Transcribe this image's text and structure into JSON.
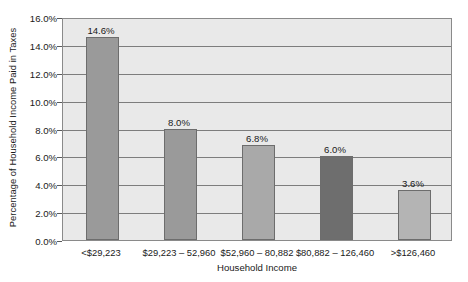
{
  "chart_data": {
    "type": "bar",
    "title": "",
    "xlabel": "Household Income",
    "ylabel": "Percentage of Household Income Paid in Taxes",
    "categories": [
      "<$29,223",
      "$29,223 – 52,960",
      "$52,960 – 80,882",
      "$80,882 – 126,460",
      ">$126,460"
    ],
    "values": [
      14.6,
      8.0,
      6.8,
      6.0,
      3.6
    ],
    "value_labels": [
      "14.6%",
      "8.0%",
      "6.8%",
      "6.0%",
      "3.6%"
    ],
    "bar_colors": [
      "#9a9a9a",
      "#9a9a9a",
      "#a9a9a9",
      "#6e6e6e",
      "#b4b4b4"
    ],
    "ylim": [
      0,
      16
    ],
    "ytick_values": [
      0,
      2,
      4,
      6,
      8,
      10,
      12,
      14,
      16
    ],
    "ytick_labels": [
      "0.0%",
      "2.0%",
      "4.0%",
      "6.0%",
      "8.0%",
      "10.0%",
      "12.0%",
      "14.0%",
      "16.0%"
    ],
    "grid": true,
    "grid_axis": "y",
    "legend": false,
    "plot_background": "#e9e9e9",
    "figure_background": "#ffffff",
    "gridline_color": "#7d7d7d",
    "bar_border_color": "#6d6d6d"
  }
}
